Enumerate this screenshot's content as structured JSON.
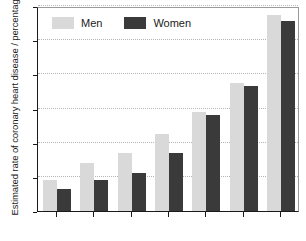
{
  "chart_data": {
    "type": "bar",
    "title": "",
    "subtitle": "",
    "xlabel": "",
    "ylabel": "Estimated rate of coronary heart disease / percentage",
    "ylim": [
      0,
      60
    ],
    "ytick_values": [
      0,
      10,
      20,
      30,
      40,
      50,
      60
    ],
    "ytick_labels": [
      "0",
      "10",
      "20",
      "30",
      "40",
      "50",
      "60"
    ],
    "grid": true,
    "grid_axis": "y",
    "grid_style": "dotted",
    "legend_position": "top-left inside",
    "categories": [
      "1",
      "2",
      "3",
      "4",
      "5",
      "6",
      "7"
    ],
    "xtick_labels": [
      "",
      "",
      "",
      "",
      "",
      "",
      ""
    ],
    "xtick_labels_note": "x-axis category labels are cut off by the bottom edge of the screenshot and are not legible",
    "series": [
      {
        "name": "Men",
        "color": "#d9d9d9",
        "values": [
          9,
          14,
          17,
          22.5,
          29,
          37.5,
          57.5
        ]
      },
      {
        "name": "Women",
        "color": "#3a3a3a",
        "values": [
          6.5,
          9,
          11,
          17,
          28,
          36.5,
          55.5
        ]
      }
    ]
  },
  "legend": {
    "items": [
      {
        "label": "Men",
        "color": "#d9d9d9"
      },
      {
        "label": "Women",
        "color": "#3a3a3a"
      }
    ]
  },
  "axes": {
    "y_title": "Estimated rate of coronary heart disease / percentage"
  },
  "colors": {
    "men": "#d9d9d9",
    "women": "#3a3a3a",
    "axis": "#1a1a1a",
    "frame": "#9a9a9a",
    "grid": "#b5b5b5",
    "background": "#ffffff"
  }
}
